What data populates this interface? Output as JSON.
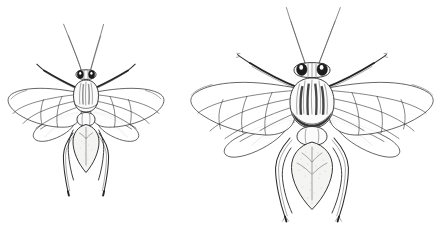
{
  "figure": {
    "background_color": "#ffffff",
    "ink_color": "#2b2b2b",
    "canvas": {
      "width": 436,
      "height": 242
    },
    "caption": "",
    "specimens": [
      {
        "id": "left-specimen",
        "label": "",
        "role": "smaller specimen",
        "orientation": "dorsal",
        "center_x": 86,
        "center_y": 120,
        "scale": 0.72,
        "body_length_px": 140,
        "wingspan_px": 158,
        "parts": [
          "antenna-left",
          "antenna-right",
          "head",
          "compound-eye-left",
          "compound-eye-right",
          "thorax",
          "scutellum",
          "forewing-left",
          "forewing-right",
          "hindwing-left",
          "hindwing-right",
          "abdomen",
          "foreleg-left",
          "foreleg-right",
          "midleg-left",
          "midleg-right",
          "hindleg-left",
          "hindleg-right"
        ]
      },
      {
        "id": "right-specimen",
        "label": "",
        "role": "larger specimen",
        "orientation": "dorsal",
        "center_x": 312,
        "center_y": 118,
        "scale": 1.0,
        "body_length_px": 205,
        "wingspan_px": 232,
        "parts": [
          "antenna-left",
          "antenna-right",
          "head",
          "compound-eye-left",
          "compound-eye-right",
          "thorax",
          "scutellum",
          "forewing-left",
          "forewing-right",
          "hindwing-left",
          "hindwing-right",
          "abdomen",
          "foreleg-left",
          "foreleg-right",
          "midleg-left",
          "midleg-right",
          "hindleg-left",
          "hindleg-right"
        ]
      }
    ]
  }
}
